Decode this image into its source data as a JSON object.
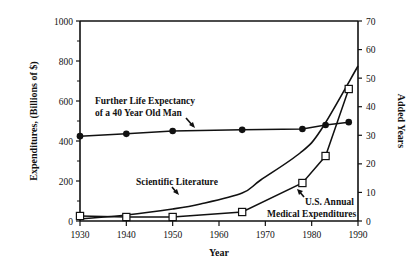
{
  "chart_data": {
    "type": "line",
    "title": "",
    "xlabel": "Year",
    "ylabel": "Expenditures, (Billions of $)",
    "ylabel_right": "Added Years",
    "xlim": [
      1930,
      1990
    ],
    "ylim": [
      0,
      1000
    ],
    "ylim_right": [
      0,
      70
    ],
    "x_ticks": [
      1930,
      1940,
      1950,
      1960,
      1970,
      1980,
      1990
    ],
    "y_ticks": [
      0,
      200,
      400,
      600,
      800,
      1000
    ],
    "y_minor_ticks": [
      100,
      300,
      500,
      700,
      900
    ],
    "y_ticks_right": [
      0,
      10,
      20,
      30,
      40,
      50,
      60,
      70
    ],
    "grid": false,
    "legend": "none (inline annotations)",
    "series": [
      {
        "name": "Further Life Expectancy of a 40 Year Old Man",
        "axis": "right",
        "marker": "filled-circle",
        "x": [
          1930,
          1940,
          1950,
          1965,
          1978,
          1983,
          1988
        ],
        "values": [
          29.7,
          30.5,
          31.5,
          31.9,
          32.2,
          33.6,
          34.6
        ]
      },
      {
        "name": "Scientific Literature",
        "axis": "left",
        "marker": "none",
        "x": [
          1930,
          1940,
          1950,
          1956,
          1965,
          1969,
          1977.5,
          1982,
          1990
        ],
        "values": [
          10,
          30,
          60,
          85,
          140,
          205,
          340,
          455,
          775
        ]
      },
      {
        "name": "U.S. Annual Medical Expenditures",
        "axis": "left",
        "marker": "open-square",
        "x": [
          1930,
          1940,
          1950,
          1965,
          1978,
          1983,
          1988
        ],
        "values": [
          25,
          20,
          20,
          45,
          190,
          325,
          660
        ]
      }
    ],
    "annotations": [
      {
        "text_lines": [
          "Further Life Expectancy",
          "of a 40 Year Old Man"
        ],
        "points_to": "life expectancy line near 1962"
      },
      {
        "text_lines": [
          "Scientific Literature"
        ],
        "points_to": "scientific literature curve near 1956"
      },
      {
        "text_lines": [
          "U.S. Annual",
          "Medical Expenditures"
        ],
        "points_to": "medical expenditures square at 1978"
      }
    ]
  },
  "labels": {
    "xlabel": "Year",
    "ylabel": "Expenditures, (Billions of $)",
    "ylabel_right": "Added Years",
    "annot_life_1": "Further Life Expectancy",
    "annot_life_2": "of a 40 Year Old Man",
    "annot_sci": "Scientific Literature",
    "annot_med_1": "U.S. Annual",
    "annot_med_2": "Medical Expenditures"
  }
}
